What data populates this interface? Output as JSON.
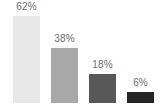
{
  "chart_data": {
    "type": "bar",
    "title": "",
    "subtitle": "",
    "xlabel": "",
    "ylabel": "",
    "grid": false,
    "legend": false,
    "ylim": [
      0,
      71
    ],
    "categories": [
      "",
      "",
      "",
      ""
    ],
    "values": [
      62,
      38,
      18,
      6
    ],
    "data_labels": [
      "62%",
      "38%",
      "18%",
      "6%"
    ],
    "bar_colors": [
      "#e8e8e8",
      "#a8a8a8",
      "#585858",
      "#252525"
    ],
    "label_color": "#6e6e6e",
    "background_color": "#ffffff",
    "bars": [
      {
        "label": "62%",
        "value": 62,
        "color": "#e8e8e8",
        "left": 13,
        "width": 27,
        "height": 87
      },
      {
        "label": "38%",
        "value": 38,
        "color": "#a8a8a8",
        "left": 51,
        "width": 27,
        "height": 55
      },
      {
        "label": "18%",
        "value": 18,
        "color": "#585858",
        "left": 89,
        "width": 27,
        "height": 29
      },
      {
        "label": "6%",
        "value": 6,
        "color": "#252525",
        "left": 127,
        "width": 27,
        "height": 11
      }
    ]
  }
}
